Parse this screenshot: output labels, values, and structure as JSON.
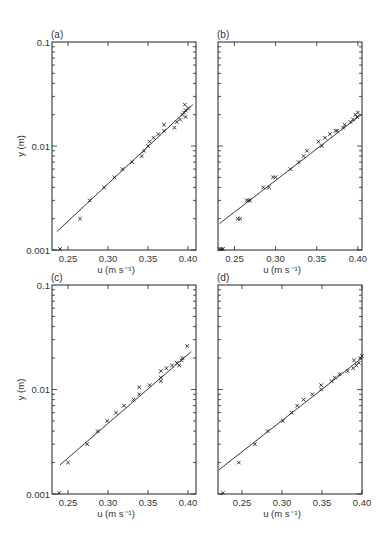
{
  "figure": {
    "width": 383,
    "height": 544,
    "colors": {
      "ink": "#222222",
      "background": "#ffffff"
    }
  },
  "chart_data": [
    {
      "panel": "(a)",
      "type": "scatter",
      "xlabel": "u (m s⁻¹)",
      "ylabel": "y (m)",
      "xscale": "linear",
      "yscale": "log",
      "xlim": [
        0.23,
        0.41
      ],
      "ylim": [
        0.001,
        0.1
      ],
      "xticks": [
        0.25,
        0.3,
        0.35,
        0.4
      ],
      "xtick_labels": [
        "0.25",
        "0.30",
        "0.35",
        "0.40"
      ],
      "yticks": [
        0.001,
        0.01,
        0.1
      ],
      "ytick_labels": [
        "0.001",
        "0.01",
        "0.1"
      ],
      "show_xlabel": true,
      "show_ylabel": true,
      "show_yticklabels": true,
      "frame_px": {
        "left": 52,
        "top": 42,
        "right": 196,
        "bottom": 250
      },
      "fit_line": {
        "x": [
          0.236,
          0.406
        ],
        "y": [
          0.0015,
          0.025
        ]
      },
      "points": [
        [
          0.24,
          0.001
        ],
        [
          0.265,
          0.002
        ],
        [
          0.277,
          0.003
        ],
        [
          0.295,
          0.004
        ],
        [
          0.308,
          0.005
        ],
        [
          0.318,
          0.006
        ],
        [
          0.33,
          0.007
        ],
        [
          0.342,
          0.008
        ],
        [
          0.345,
          0.009
        ],
        [
          0.35,
          0.01
        ],
        [
          0.352,
          0.011
        ],
        [
          0.357,
          0.012
        ],
        [
          0.363,
          0.013
        ],
        [
          0.37,
          0.014
        ],
        [
          0.37,
          0.016
        ],
        [
          0.383,
          0.015
        ],
        [
          0.386,
          0.017
        ],
        [
          0.39,
          0.018
        ],
        [
          0.393,
          0.02
        ],
        [
          0.395,
          0.021
        ],
        [
          0.397,
          0.022
        ],
        [
          0.396,
          0.025
        ],
        [
          0.397,
          0.019
        ],
        [
          0.4,
          0.023
        ]
      ],
      "grid": false,
      "legend": null
    },
    {
      "panel": "(b)",
      "type": "scatter",
      "xlabel": "u (m s⁻¹)",
      "ylabel": "",
      "xscale": "linear",
      "yscale": "log",
      "xlim": [
        0.23,
        0.405
      ],
      "ylim": [
        0.001,
        0.1
      ],
      "xticks": [
        0.25,
        0.3,
        0.35,
        0.4
      ],
      "xtick_labels": [
        "0.25",
        "0.30",
        "0.35",
        "0.40"
      ],
      "yticks": [
        0.001,
        0.01,
        0.1
      ],
      "ytick_labels": [],
      "show_xlabel": true,
      "show_ylabel": false,
      "show_yticklabels": false,
      "frame_px": {
        "left": 218,
        "top": 42,
        "right": 362,
        "bottom": 250
      },
      "fit_line": {
        "x": [
          0.232,
          0.404
        ],
        "y": [
          0.0018,
          0.02
        ]
      },
      "points": [
        [
          0.232,
          0.001
        ],
        [
          0.234,
          0.001
        ],
        [
          0.236,
          0.001
        ],
        [
          0.254,
          0.002
        ],
        [
          0.257,
          0.002
        ],
        [
          0.265,
          0.003
        ],
        [
          0.267,
          0.003
        ],
        [
          0.269,
          0.003
        ],
        [
          0.285,
          0.004
        ],
        [
          0.292,
          0.004
        ],
        [
          0.297,
          0.005
        ],
        [
          0.3,
          0.005
        ],
        [
          0.318,
          0.006
        ],
        [
          0.328,
          0.007
        ],
        [
          0.334,
          0.008
        ],
        [
          0.338,
          0.009
        ],
        [
          0.352,
          0.011
        ],
        [
          0.356,
          0.01
        ],
        [
          0.36,
          0.012
        ],
        [
          0.366,
          0.013
        ],
        [
          0.373,
          0.014
        ],
        [
          0.375,
          0.014
        ],
        [
          0.382,
          0.015
        ],
        [
          0.384,
          0.016
        ],
        [
          0.391,
          0.017
        ],
        [
          0.394,
          0.018
        ],
        [
          0.397,
          0.02
        ],
        [
          0.399,
          0.019
        ],
        [
          0.4,
          0.021
        ]
      ],
      "grid": false,
      "legend": null
    },
    {
      "panel": "(c)",
      "type": "scatter",
      "xlabel": "u (m s⁻¹)",
      "ylabel": "y (m)",
      "xscale": "linear",
      "yscale": "log",
      "xlim": [
        0.23,
        0.41
      ],
      "ylim": [
        0.001,
        0.1
      ],
      "xticks": [
        0.25,
        0.3,
        0.35,
        0.4
      ],
      "xtick_labels": [
        "0.25",
        "0.30",
        "0.35",
        "0.40"
      ],
      "yticks": [
        0.001,
        0.01,
        0.1
      ],
      "ytick_labels": [
        "0.001",
        "0.01",
        "0.1"
      ],
      "show_xlabel": true,
      "show_ylabel": true,
      "show_yticklabels": true,
      "frame_px": {
        "left": 52,
        "top": 285,
        "right": 196,
        "bottom": 494
      },
      "fit_line": {
        "x": [
          0.24,
          0.404
        ],
        "y": [
          0.0019,
          0.023
        ]
      },
      "points": [
        [
          0.239,
          0.001
        ],
        [
          0.25,
          0.002
        ],
        [
          0.274,
          0.003
        ],
        [
          0.287,
          0.004
        ],
        [
          0.299,
          0.005
        ],
        [
          0.31,
          0.006
        ],
        [
          0.32,
          0.007
        ],
        [
          0.332,
          0.008
        ],
        [
          0.339,
          0.009
        ],
        [
          0.339,
          0.0105
        ],
        [
          0.352,
          0.011
        ],
        [
          0.366,
          0.012
        ],
        [
          0.366,
          0.013
        ],
        [
          0.366,
          0.015
        ],
        [
          0.373,
          0.016
        ],
        [
          0.38,
          0.017
        ],
        [
          0.386,
          0.018
        ],
        [
          0.389,
          0.017
        ],
        [
          0.392,
          0.019
        ],
        [
          0.393,
          0.02
        ],
        [
          0.399,
          0.026
        ]
      ],
      "grid": false,
      "legend": null
    },
    {
      "panel": "(d)",
      "type": "scatter",
      "xlabel": "u (m s⁻¹)",
      "ylabel": "",
      "xscale": "linear",
      "yscale": "log",
      "xlim": [
        0.22,
        0.4
      ],
      "ylim": [
        0.001,
        0.1
      ],
      "xticks": [
        0.25,
        0.3,
        0.35,
        0.4
      ],
      "xtick_labels": [
        "0.25",
        "0.30",
        "0.35",
        "0.40"
      ],
      "yticks": [
        0.001,
        0.01,
        0.1
      ],
      "ytick_labels": [],
      "show_xlabel": true,
      "show_ylabel": false,
      "show_yticklabels": false,
      "frame_px": {
        "left": 218,
        "top": 285,
        "right": 362,
        "bottom": 494
      },
      "fit_line": {
        "x": [
          0.221,
          0.4
        ],
        "y": [
          0.0017,
          0.02
        ]
      },
      "points": [
        [
          0.226,
          0.001
        ],
        [
          0.246,
          0.002
        ],
        [
          0.266,
          0.003
        ],
        [
          0.282,
          0.004
        ],
        [
          0.301,
          0.005
        ],
        [
          0.312,
          0.006
        ],
        [
          0.319,
          0.007
        ],
        [
          0.327,
          0.008
        ],
        [
          0.338,
          0.009
        ],
        [
          0.349,
          0.01
        ],
        [
          0.349,
          0.011
        ],
        [
          0.362,
          0.012
        ],
        [
          0.366,
          0.013
        ],
        [
          0.372,
          0.014
        ],
        [
          0.382,
          0.015
        ],
        [
          0.389,
          0.016
        ],
        [
          0.39,
          0.019
        ],
        [
          0.393,
          0.017
        ],
        [
          0.396,
          0.018
        ],
        [
          0.398,
          0.02
        ],
        [
          0.4,
          0.021
        ]
      ],
      "grid": false,
      "legend": null
    }
  ]
}
